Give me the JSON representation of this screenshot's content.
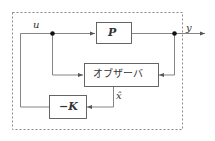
{
  "diagram": {
    "type": "block-diagram",
    "title": "",
    "colors": {
      "line": "#555555",
      "dashed_border": "#888888",
      "text": "#333333",
      "background": "#ffffff"
    },
    "signals": {
      "input": "u",
      "output": "y",
      "estimate": "x̂"
    },
    "blocks": {
      "plant": {
        "label": "P"
      },
      "observer": {
        "label": "オブザーバ"
      },
      "gain": {
        "label": "−K"
      }
    },
    "edges": [
      {
        "from": "u-junction",
        "to": "plant",
        "signal": "u"
      },
      {
        "from": "plant",
        "to": "output",
        "signal": "y"
      },
      {
        "from": "y-junction",
        "to": "observer"
      },
      {
        "from": "u-junction",
        "to": "observer"
      },
      {
        "from": "observer",
        "to": "gain",
        "signal": "x̂"
      },
      {
        "from": "gain",
        "to": "u-junction"
      }
    ],
    "enclosure": {
      "style": "dashed"
    }
  }
}
